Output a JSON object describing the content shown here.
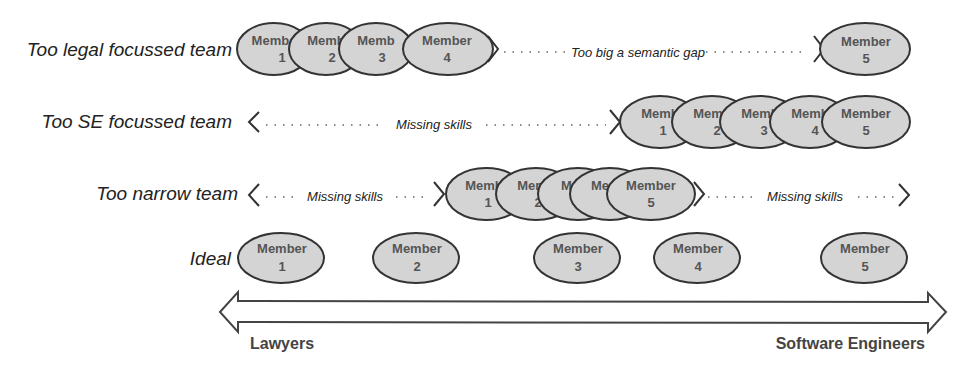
{
  "rows": [
    {
      "label": "Too legal focussed team",
      "gaps": [
        {
          "text": "Too big a semantic gap"
        }
      ],
      "members": [
        {
          "word": "Membe",
          "num": "1"
        },
        {
          "word": "Memb",
          "num": "2"
        },
        {
          "word": "Memb",
          "num": "3"
        },
        {
          "word": "Member",
          "num": "4"
        },
        {
          "word": "Member",
          "num": "5"
        }
      ]
    },
    {
      "label": "Too SE focussed team",
      "gaps": [
        {
          "text": "Missing skills"
        }
      ],
      "members": [
        {
          "word": "Memb",
          "num": "1"
        },
        {
          "word": "Memb",
          "num": "2"
        },
        {
          "word": "Memb",
          "num": "3"
        },
        {
          "word": "Memb",
          "num": "4"
        },
        {
          "word": "Member",
          "num": "5"
        }
      ]
    },
    {
      "label": "Too narrow team",
      "gaps": [
        {
          "text": "Missing skills"
        },
        {
          "text": "Missing skills"
        }
      ],
      "members": [
        {
          "word": "Memb",
          "num": "1"
        },
        {
          "word": "Memb",
          "num": "2"
        },
        {
          "word": "Me",
          "num": ""
        },
        {
          "word": "Me",
          "num": ""
        },
        {
          "word": "Member",
          "num": "5"
        }
      ]
    },
    {
      "label": "Ideal",
      "gaps": [],
      "members": [
        {
          "word": "Member",
          "num": "1"
        },
        {
          "word": "Member",
          "num": "2"
        },
        {
          "word": "Member",
          "num": "3"
        },
        {
          "word": "Member",
          "num": "4"
        },
        {
          "word": "Member",
          "num": "5"
        }
      ]
    }
  ],
  "axis": {
    "left_label": "Lawyers",
    "right_label": "Software Engineers"
  },
  "colors": {
    "ellipse_fill": "#d4d4d4",
    "ellipse_stroke": "#333333",
    "text": "#222222"
  }
}
